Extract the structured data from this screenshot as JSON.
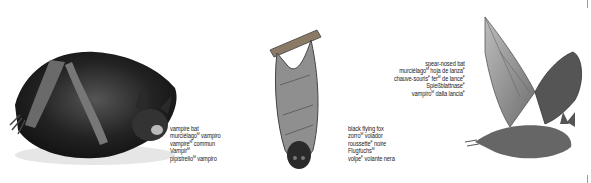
{
  "entries": [
    {
      "name": "vampire bat",
      "illustration": "vampire-bat-crouching",
      "lines": [
        {
          "text": "vampire bat",
          "gender": ""
        },
        {
          "text": "murciélago",
          "gender": "M",
          "rest": " vampiro",
          "rest_gender": ""
        },
        {
          "text": "vampire",
          "gender": "M",
          "rest": " commun",
          "rest_gender": ""
        },
        {
          "text": "Vampir",
          "gender": "M",
          "rest": "",
          "rest_gender": ""
        },
        {
          "text": "pipistrello",
          "gender": "M",
          "rest": " vampiro",
          "rest_gender": ""
        }
      ]
    },
    {
      "name": "black flying fox",
      "illustration": "flying-fox-hanging",
      "lines": [
        {
          "text": "black flying fox",
          "gender": ""
        },
        {
          "text": "zorro",
          "gender": "M",
          "rest": " volador",
          "rest_gender": ""
        },
        {
          "text": "roussette",
          "gender": "F",
          "rest": " noire",
          "rest_gender": ""
        },
        {
          "text": "Flugfuchs",
          "gender": "M",
          "rest": "",
          "rest_gender": ""
        },
        {
          "text": "volpe",
          "gender": "F",
          "rest": " volante nera",
          "rest_gender": ""
        }
      ]
    },
    {
      "name": "spear-nosed bat",
      "illustration": "spear-nosed-bat-flying",
      "lines": [
        {
          "text": "spear-nosed bat",
          "gender": ""
        },
        {
          "text": "murciélago",
          "gender": "M",
          "rest": " hoja de lanza",
          "rest_gender": "F"
        },
        {
          "text": "chauve-souris",
          "gender": "F",
          "rest": " fer",
          "rest_gender": "M",
          "rest2": " de lance",
          "rest2_gender": "F"
        },
        {
          "text": "Spießblattnase",
          "gender": "F",
          "rest": "",
          "rest_gender": ""
        },
        {
          "text": "vampiro",
          "gender": "M",
          "rest": " dalla lancia",
          "rest_gender": "F"
        }
      ]
    }
  ],
  "colors": {
    "ink": "#1a1a1a",
    "fur_dark": "#2b2b2b",
    "membrane": "#8a8a8a",
    "crop_mark": "#999999"
  }
}
